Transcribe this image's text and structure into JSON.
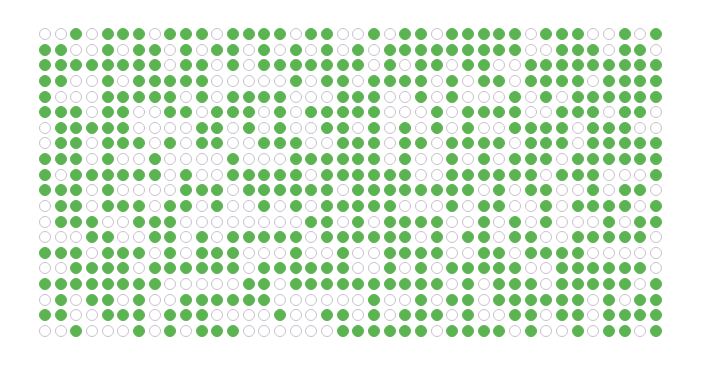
{
  "chart_data": {
    "type": "waffle",
    "title": "",
    "rows": 20,
    "cols": 40,
    "colors": {
      "filled": "#5cb352",
      "empty_fill": "#ffffff",
      "empty_stroke": "#c9c2cd"
    },
    "grid": [
      "0010111011101111011001011011111011100101",
      "1100101101011010101010111111111001110110",
      "1111111101101011111110101101100111111111",
      "1100101111100000101101111010110111101111",
      "1000111110101111000111001010001010111111",
      "1110110011011101011111000101111001110110",
      "0111110000110101001101010101001111011100",
      "0110111010110011100111011011110111011111",
      "1110100100001000111111010010101110111111",
      "1011111101001111101111110011111101110001",
      "1110100001110111111011111111010110010110",
      "0110111011010010101111100010110010111101",
      "0111001110000000011010111100101010001011",
      "0001100110101111101111110101101100111110",
      "1110111010111000100100111100110111100000",
      "0011110111111011111100101011111001111110",
      "1111111100000110111111111101011101111101",
      "0101101001111110000001001011011111101011",
      "1100111011100001001101011101001101101111",
      "0010001010111000000111111011110100101101"
    ],
    "filled_count_note": "1 = filled green circle, 0 = empty outlined circle",
    "xlabel": "",
    "ylabel": "",
    "legend": []
  }
}
